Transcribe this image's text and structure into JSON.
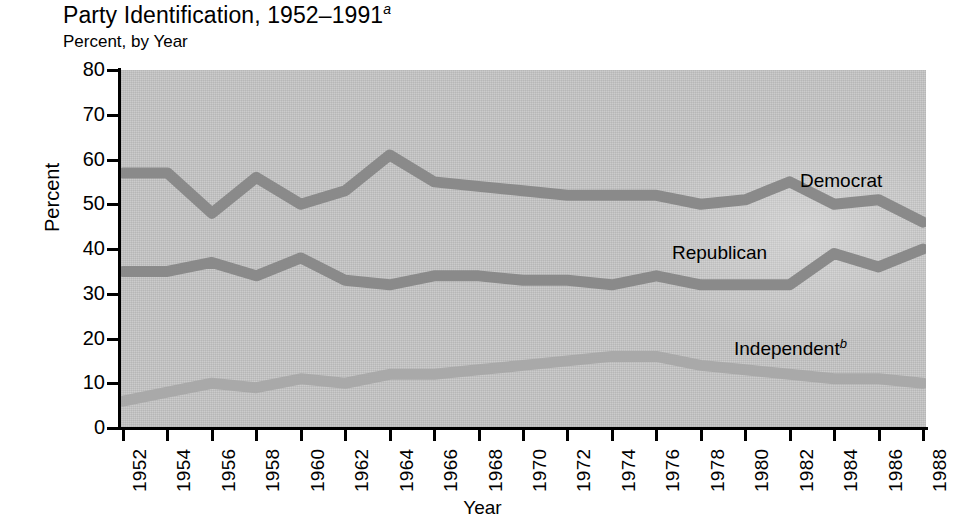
{
  "header": {
    "title": "Party Identification, 1952–1991",
    "title_superscript": "a",
    "subtitle": "Percent, by Year"
  },
  "annotations": {
    "democrat": "Democrat",
    "republican": "Republican",
    "independent": "Independent",
    "independent_superscript": "b"
  },
  "colors": {
    "plot_background": "#c6c6c6",
    "democrat": "#8a8a8a",
    "republican": "#8a8a8a",
    "independent": "#a9a9a9",
    "axis": "#000000",
    "page_background": "#ffffff"
  },
  "chart_data": {
    "type": "line",
    "title": "Party Identification, 1952–1991",
    "subtitle": "Percent, by Year",
    "xlabel": "Year",
    "ylabel": "Percent",
    "ylim": [
      0,
      80
    ],
    "yticks": [
      0,
      10,
      20,
      30,
      40,
      50,
      60,
      70,
      80
    ],
    "grid": false,
    "legend_position": "inline-labels",
    "x": [
      1952,
      1954,
      1956,
      1958,
      1960,
      1962,
      1964,
      1966,
      1968,
      1970,
      1972,
      1974,
      1976,
      1978,
      1980,
      1982,
      1984,
      1986,
      1988
    ],
    "xtick_labels": [
      "1952",
      "1954",
      "1956",
      "1958",
      "1960",
      "1962",
      "1964",
      "1966",
      "1968",
      "1970",
      "1972",
      "1974",
      "1976",
      "1978",
      "1980",
      "1982",
      "1984",
      "1986",
      "1988"
    ],
    "series": [
      {
        "name": "Democrat",
        "color": "#8a8a8a",
        "values": [
          57,
          57,
          48,
          56,
          50,
          53,
          61,
          55,
          54,
          53,
          52,
          52,
          52,
          50,
          51,
          55,
          50,
          51,
          46
        ]
      },
      {
        "name": "Republican",
        "color": "#8a8a8a",
        "values": [
          35,
          35,
          37,
          34,
          38,
          33,
          32,
          34,
          34,
          33,
          33,
          32,
          34,
          32,
          32,
          32,
          39,
          36,
          40
        ]
      },
      {
        "name": "Independent",
        "color": "#a9a9a9",
        "values": [
          6,
          8,
          10,
          9,
          11,
          10,
          12,
          12,
          13,
          14,
          15,
          16,
          16,
          14,
          13,
          12,
          11,
          11,
          10
        ]
      }
    ]
  }
}
